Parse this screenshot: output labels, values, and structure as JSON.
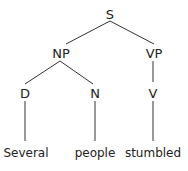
{
  "tree": {
    "root": "S",
    "nodes": {
      "s": "S",
      "np": "NP",
      "vp": "VP",
      "d": "D",
      "n": "N",
      "v": "V"
    },
    "words": {
      "several": "Several",
      "people": "people",
      "stumbled": "stumbled"
    },
    "edges": [
      [
        "S",
        "NP"
      ],
      [
        "S",
        "VP"
      ],
      [
        "NP",
        "D"
      ],
      [
        "NP",
        "N"
      ],
      [
        "VP",
        "V"
      ],
      [
        "D",
        "Several"
      ],
      [
        "N",
        "people"
      ],
      [
        "V",
        "stumbled"
      ]
    ],
    "colors": {
      "ink": "#222222",
      "background": "#ffffff"
    }
  }
}
